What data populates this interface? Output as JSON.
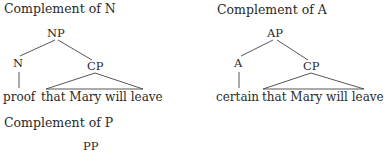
{
  "diagrams": [
    {
      "title": "Complement of N",
      "root": "NP",
      "head": "N",
      "complement": "CP",
      "head_word": "proof",
      "complement_text": "that Mary will leave"
    },
    {
      "title": "Complement of A",
      "root": "AP",
      "head": "A",
      "complement": "CP",
      "head_word": "certain",
      "complement_text": "that Mary will leave"
    },
    {
      "title": "Complement of P",
      "root": "PP"
    }
  ]
}
